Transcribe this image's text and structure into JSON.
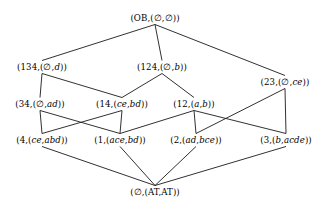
{
  "diagram": {
    "line_color": "#1a1a1a",
    "background_color": "#ffffff",
    "text_color": "#000000",
    "nodes": [
      {
        "id": "top",
        "label": "(OB,(∅,∅))",
        "extent": "OB",
        "intent_a": "∅",
        "intent_b": "∅",
        "x": 155,
        "y": 18
      },
      {
        "id": "n134",
        "label": "(134,(∅,d))",
        "extent": "134",
        "intent_a": "∅",
        "intent_b": "d",
        "x": 42,
        "y": 67
      },
      {
        "id": "n124",
        "label": "(124,(∅,b))",
        "extent": "124",
        "intent_a": "∅",
        "intent_b": "b",
        "x": 162,
        "y": 67
      },
      {
        "id": "n23",
        "label": "(23,(∅,ce))",
        "extent": "23",
        "intent_a": "∅",
        "intent_b": "ce",
        "x": 285,
        "y": 82
      },
      {
        "id": "n34",
        "label": "(34,(∅,ad))",
        "extent": "34",
        "intent_a": "∅",
        "intent_b": "ad",
        "x": 40,
        "y": 104
      },
      {
        "id": "n14",
        "label": "(14,(ce,bd))",
        "extent": "14",
        "intent_a": "ce",
        "intent_b": "bd",
        "x": 122,
        "y": 104
      },
      {
        "id": "n12",
        "label": "(12,(a,b))",
        "extent": "12",
        "intent_a": "a",
        "intent_b": "b",
        "x": 194,
        "y": 104
      },
      {
        "id": "n4",
        "label": "(4,(ce,abd))",
        "extent": "4",
        "intent_a": "ce",
        "intent_b": "abd",
        "x": 42,
        "y": 140
      },
      {
        "id": "n1",
        "label": "(1,(ace,bd))",
        "extent": "1",
        "intent_a": "ace",
        "intent_b": "bd",
        "x": 120,
        "y": 140
      },
      {
        "id": "n2",
        "label": "(2,(ad,bce))",
        "extent": "2",
        "intent_a": "ad",
        "intent_b": "bce",
        "x": 196,
        "y": 140
      },
      {
        "id": "n3",
        "label": "(3,(b,acde))",
        "extent": "3",
        "intent_a": "b",
        "intent_b": "acde",
        "x": 286,
        "y": 140
      },
      {
        "id": "bot",
        "label": "(∅,(AT,AT))",
        "extent": "∅",
        "intent_a": "AT",
        "intent_b": "AT",
        "x": 155,
        "y": 192
      }
    ],
    "edges": [
      {
        "from": "top",
        "to": "n134"
      },
      {
        "from": "top",
        "to": "n124"
      },
      {
        "from": "top",
        "to": "n23"
      },
      {
        "from": "n134",
        "to": "n34"
      },
      {
        "from": "n134",
        "to": "n14"
      },
      {
        "from": "n124",
        "to": "n14"
      },
      {
        "from": "n124",
        "to": "n12"
      },
      {
        "from": "n34",
        "to": "n4"
      },
      {
        "from": "n34",
        "to": "n1"
      },
      {
        "from": "n14",
        "to": "n4"
      },
      {
        "from": "n14",
        "to": "n1"
      },
      {
        "from": "n12",
        "to": "n1"
      },
      {
        "from": "n12",
        "to": "n2"
      },
      {
        "from": "n23",
        "to": "n2"
      },
      {
        "from": "n23",
        "to": "n3"
      },
      {
        "from": "n12",
        "to": "n3"
      },
      {
        "from": "n4",
        "to": "bot"
      },
      {
        "from": "n1",
        "to": "bot"
      },
      {
        "from": "n2",
        "to": "bot"
      },
      {
        "from": "n3",
        "to": "bot"
      }
    ]
  }
}
